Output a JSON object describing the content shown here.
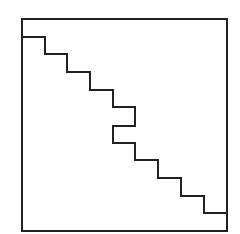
{
  "diagram": {
    "colors": {
      "background": "#ffffff",
      "stroke": "#222222"
    },
    "stroke_width": 2,
    "frame": {
      "x": 22,
      "y": 19,
      "width": 205,
      "height": 212
    },
    "staircase_points": [
      [
        22,
        37
      ],
      [
        45,
        37
      ],
      [
        45,
        54
      ],
      [
        67,
        54
      ],
      [
        67,
        72
      ],
      [
        90,
        72
      ],
      [
        90,
        90
      ],
      [
        113,
        90
      ],
      [
        113,
        107
      ],
      [
        135,
        107
      ],
      [
        135,
        126
      ],
      [
        113,
        126
      ],
      [
        113,
        143
      ],
      [
        135,
        143
      ],
      [
        135,
        160
      ],
      [
        158,
        160
      ],
      [
        158,
        178
      ],
      [
        181,
        178
      ],
      [
        181,
        196
      ],
      [
        204,
        196
      ],
      [
        204,
        213
      ],
      [
        227,
        213
      ]
    ]
  }
}
